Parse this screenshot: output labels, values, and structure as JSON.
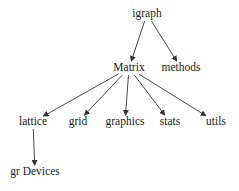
{
  "diagram": {
    "type": "dependency-graph",
    "nodes": [
      {
        "id": "igraph",
        "label": "igraph",
        "x": 147,
        "y": 14
      },
      {
        "id": "Matrix",
        "label": "Matrix",
        "x": 129,
        "y": 68
      },
      {
        "id": "methods",
        "label": "methods",
        "x": 181,
        "y": 68
      },
      {
        "id": "lattice",
        "label": "lattice",
        "x": 33,
        "y": 122
      },
      {
        "id": "grid",
        "label": "grid",
        "x": 78,
        "y": 122
      },
      {
        "id": "graphics",
        "label": "graphics",
        "x": 125,
        "y": 122
      },
      {
        "id": "stats",
        "label": "stats",
        "x": 170,
        "y": 122
      },
      {
        "id": "utils",
        "label": "utils",
        "x": 216,
        "y": 122
      },
      {
        "id": "grDevices",
        "label": "gr Devices",
        "x": 35,
        "y": 172
      }
    ],
    "edges": [
      {
        "from": "igraph",
        "to": "Matrix"
      },
      {
        "from": "igraph",
        "to": "methods"
      },
      {
        "from": "Matrix",
        "to": "lattice"
      },
      {
        "from": "Matrix",
        "to": "grid"
      },
      {
        "from": "Matrix",
        "to": "graphics"
      },
      {
        "from": "Matrix",
        "to": "stats"
      },
      {
        "from": "Matrix",
        "to": "utils"
      },
      {
        "from": "lattice",
        "to": "grDevices"
      }
    ],
    "colors": {
      "edge": "#333333",
      "text": "#1a1a1a",
      "background": "#ffffff"
    }
  }
}
